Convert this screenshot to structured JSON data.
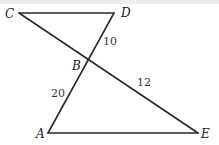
{
  "diagram": {
    "type": "geometry",
    "points": [
      {
        "id": "C",
        "label": "C"
      },
      {
        "id": "D",
        "label": "D"
      },
      {
        "id": "B",
        "label": "B"
      },
      {
        "id": "A",
        "label": "A"
      },
      {
        "id": "E",
        "label": "E"
      }
    ],
    "segments": [
      {
        "from": "C",
        "to": "D",
        "length_label": ""
      },
      {
        "from": "C",
        "to": "E",
        "length_label": ""
      },
      {
        "from": "D",
        "to": "A",
        "length_label": ""
      },
      {
        "from": "A",
        "to": "E",
        "length_label": ""
      },
      {
        "from": "B",
        "to": "D",
        "length_label": "10"
      },
      {
        "from": "A",
        "to": "B",
        "length_label": "20"
      },
      {
        "from": "B",
        "to": "E",
        "length_label": "12"
      }
    ],
    "labels": {
      "C": "C",
      "D": "D",
      "B": "B",
      "A": "A",
      "E": "E",
      "BD": "10",
      "AB": "20",
      "BE": "12"
    }
  }
}
